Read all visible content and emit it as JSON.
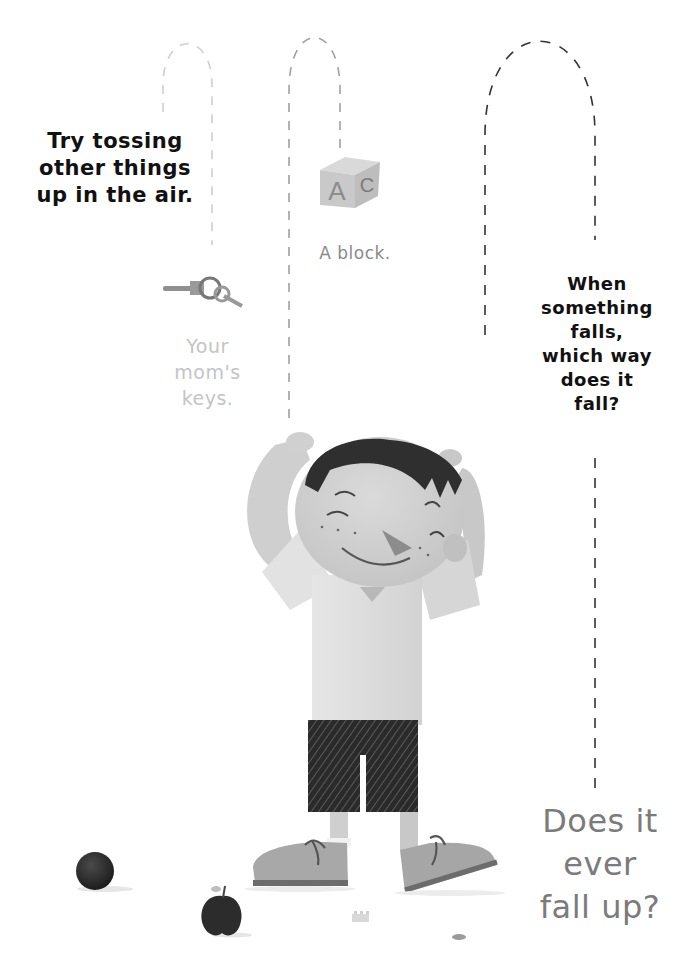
{
  "page": {
    "background": "#ffffff",
    "text_blocks": {
      "intro": "Try tossing\nother things\nup in the air.",
      "block_label": "A block.",
      "keys_label": "Your\nmom's\nkeys.",
      "question": "When\nsomething\nfalls,\nwhich way\ndoes it\nfall?",
      "final_question": "Does it\never\nfall up?"
    },
    "block_letters": {
      "front": "A",
      "side": "C"
    },
    "colors": {
      "intro_text": "#111111",
      "block_text": "#8a8a8a",
      "keys_text": "#c4c4c4",
      "final_text": "#7b7b7b",
      "dash_light": "#c8c8c8",
      "dash_mid": "#9a9a9a",
      "dash_dark": "#333333"
    }
  }
}
